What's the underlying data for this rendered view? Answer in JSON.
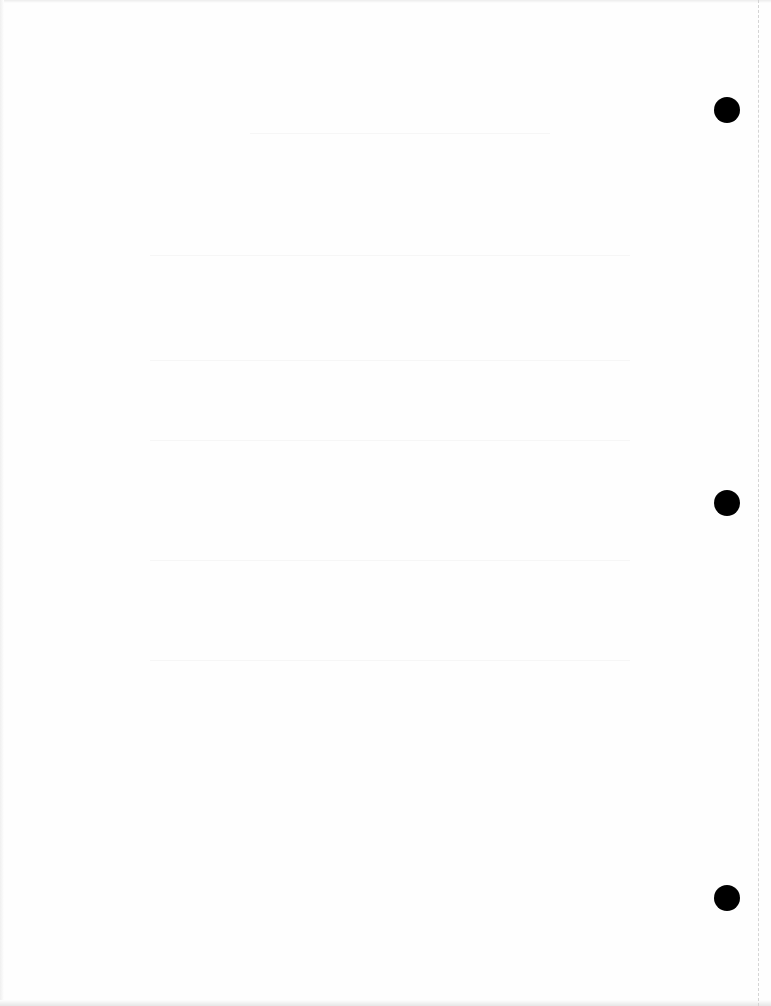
{
  "document": {
    "type": "scanned-blank-page",
    "background_color": "#fefefe",
    "hole_color": "#000000",
    "punch_holes": [
      {
        "label": "top-hole",
        "cx": 727,
        "cy": 110
      },
      {
        "label": "middle-hole",
        "cx": 727,
        "cy": 503
      },
      {
        "label": "bottom-hole",
        "cx": 727,
        "cy": 898
      }
    ],
    "perforation_x": 758,
    "legible_text": []
  }
}
